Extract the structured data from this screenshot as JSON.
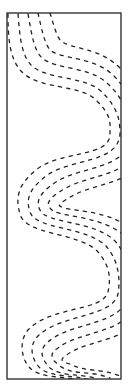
{
  "diagram": {
    "frame": {
      "x": 7,
      "y": 13,
      "width": 114,
      "height": 366,
      "stroke": "#333333"
    },
    "curves": {
      "count": 5,
      "style": "dashed",
      "color": "#222222",
      "spacing_px": 10
    }
  }
}
